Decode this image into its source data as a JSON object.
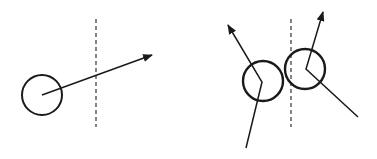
{
  "diagram": {
    "colors": {
      "stroke": "#1a1a1a",
      "background": "#ffffff"
    },
    "panels": [
      {
        "name": "before",
        "boundary": {
          "x": 96,
          "y1": 19,
          "y2": 127
        },
        "balls": [
          {
            "cx": 42,
            "cy": 95,
            "r": 20
          }
        ],
        "arrows": [
          {
            "x1": 42,
            "y1": 95,
            "x2": 152,
            "y2": 55
          }
        ]
      },
      {
        "name": "after",
        "boundary": {
          "x": 291,
          "y1": 19,
          "y2": 127
        },
        "balls": [
          {
            "cx": 263,
            "cy": 81,
            "r": 20
          },
          {
            "cx": 305,
            "cy": 69,
            "r": 20
          }
        ],
        "paths": [
          {
            "points": [
              [
                246,
                148
              ],
              [
                262,
                82
              ],
              [
                228,
                25
              ]
            ],
            "arrow": true
          },
          {
            "points": [
              [
                358,
                117
              ],
              [
                306,
                69
              ],
              [
                323,
                12
              ]
            ],
            "arrow": true
          }
        ]
      }
    ]
  }
}
